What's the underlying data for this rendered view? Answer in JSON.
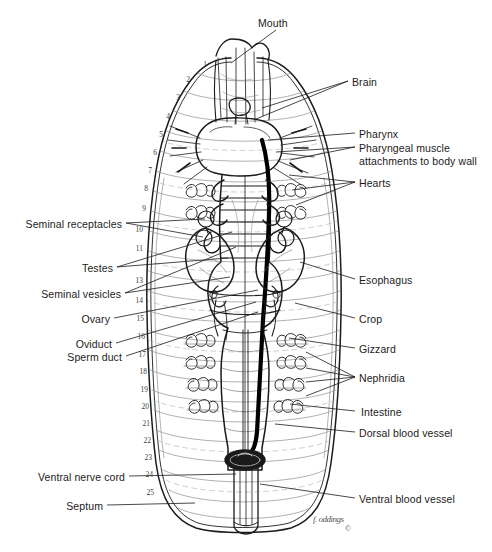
{
  "figure": {
    "background_color": "#ffffff",
    "ink_color": "#1a1a1a",
    "signature": "f. oddings",
    "copyright_mark": "©"
  },
  "labels": {
    "top": [
      {
        "text": "Mouth",
        "side": "center",
        "x": 258,
        "y": 17,
        "leader": [
          [
            276,
            30
          ],
          [
            231,
            63
          ]
        ]
      }
    ],
    "right": [
      {
        "text": "Brain",
        "x": 352,
        "y": 76,
        "leaders": [
          [
            [
              348,
              81
            ],
            [
              262,
              108
            ]
          ],
          [
            [
              348,
              81
            ],
            [
              256,
              119
            ]
          ]
        ]
      },
      {
        "text": "Pharynx",
        "x": 359,
        "y": 128,
        "leaders": [
          [
            [
              355,
              133
            ],
            [
              268,
              140
            ]
          ]
        ]
      },
      {
        "text": "Pharyngeal muscle",
        "x": 359,
        "y": 142,
        "text2": "attachments to body wall",
        "leaders": [
          [
            [
              355,
              147
            ],
            [
              276,
              152
            ]
          ],
          [
            [
              355,
              147
            ],
            [
              290,
              160
            ]
          ]
        ]
      },
      {
        "text": "Hearts",
        "x": 359,
        "y": 177,
        "leaders": [
          [
            [
              355,
              182
            ],
            [
              289,
              175
            ]
          ],
          [
            [
              355,
              182
            ],
            [
              292,
              190
            ]
          ],
          [
            [
              355,
              182
            ],
            [
              296,
              205
            ]
          ]
        ]
      },
      {
        "text": "Esophagus",
        "x": 359,
        "y": 274,
        "leaders": [
          [
            [
              355,
              279
            ],
            [
              300,
              262
            ]
          ]
        ]
      },
      {
        "text": "Crop",
        "x": 359,
        "y": 313,
        "leaders": [
          [
            [
              355,
              318
            ],
            [
              295,
              303
            ]
          ]
        ]
      },
      {
        "text": "Gizzard",
        "x": 359,
        "y": 343,
        "leaders": [
          [
            [
              355,
              348
            ],
            [
              289,
              338
            ]
          ]
        ]
      },
      {
        "text": "Nephridia",
        "x": 359,
        "y": 372,
        "leaders": [
          [
            [
              355,
              377
            ],
            [
              306,
              352
            ]
          ],
          [
            [
              355,
              377
            ],
            [
              306,
              368
            ]
          ],
          [
            [
              355,
              377
            ],
            [
              306,
              382
            ]
          ],
          [
            [
              355,
              377
            ],
            [
              306,
              396
            ]
          ]
        ]
      },
      {
        "text": "Intestine",
        "x": 361,
        "y": 406,
        "leaders": [
          [
            [
              355,
              411
            ],
            [
              290,
              404
            ]
          ]
        ]
      },
      {
        "text": "Dorsal blood vessel",
        "x": 359,
        "y": 427,
        "leaders": [
          [
            [
              355,
              432
            ],
            [
              275,
              424
            ]
          ]
        ]
      },
      {
        "text": "Ventral blood vessel",
        "x": 359,
        "y": 493,
        "leaders": [
          [
            [
              355,
              498
            ],
            [
              260,
              484
            ]
          ]
        ]
      }
    ],
    "left": [
      {
        "text": "Seminal receptacles",
        "x": 122,
        "y": 218,
        "leaders": [
          [
            [
              126,
              223
            ],
            [
              205,
              219
            ]
          ],
          [
            [
              126,
              223
            ],
            [
              203,
              237
            ]
          ]
        ]
      },
      {
        "text": "Testes",
        "x": 113,
        "y": 262,
        "leaders": [
          [
            [
              117,
              267
            ],
            [
              232,
              232
            ]
          ],
          [
            [
              117,
              267
            ],
            [
              228,
              258
            ]
          ]
        ]
      },
      {
        "text": "Seminal vesicles",
        "x": 121,
        "y": 288,
        "leaders": [
          [
            [
              125,
              293
            ],
            [
              236,
              247
            ]
          ],
          [
            [
              125,
              293
            ],
            [
              230,
              277
            ]
          ]
        ]
      },
      {
        "text": "Ovary",
        "x": 110,
        "y": 313,
        "leaders": [
          [
            [
              114,
              318
            ],
            [
              258,
              290
            ]
          ]
        ]
      },
      {
        "text": "Oviduct",
        "x": 112,
        "y": 338,
        "leaders": [
          [
            [
              116,
              343
            ],
            [
              256,
              302
            ]
          ]
        ]
      },
      {
        "text": "Sperm duct",
        "x": 122,
        "y": 351,
        "leaders": [
          [
            [
              126,
              356
            ],
            [
              258,
              312
            ]
          ]
        ]
      },
      {
        "text": "Ventral nerve cord",
        "x": 125,
        "y": 471,
        "leaders": [
          [
            [
              129,
              476
            ],
            [
              236,
              474
            ]
          ]
        ]
      },
      {
        "text": "Septum",
        "x": 103,
        "y": 500,
        "leaders": [
          [
            [
              107,
              505
            ],
            [
              195,
              503
            ]
          ]
        ]
      }
    ]
  },
  "segment_numbers": [
    {
      "n": "1",
      "x": 207,
      "y": 61
    },
    {
      "n": "2",
      "x": 190,
      "y": 76
    },
    {
      "n": "3",
      "x": 180,
      "y": 94
    },
    {
      "n": "4",
      "x": 170,
      "y": 113
    },
    {
      "n": "5",
      "x": 163,
      "y": 131
    },
    {
      "n": "6",
      "x": 157,
      "y": 149
    },
    {
      "n": "7",
      "x": 152,
      "y": 167
    },
    {
      "n": "8",
      "x": 148,
      "y": 185
    },
    {
      "n": "9",
      "x": 146,
      "y": 205
    },
    {
      "n": "10",
      "x": 143,
      "y": 226
    },
    {
      "n": "11",
      "x": 143,
      "y": 245
    },
    {
      "n": "13",
      "x": 143,
      "y": 277
    },
    {
      "n": "14",
      "x": 143,
      "y": 297
    },
    {
      "n": "15",
      "x": 144,
      "y": 315
    },
    {
      "n": "16",
      "x": 145,
      "y": 333
    },
    {
      "n": "17",
      "x": 146,
      "y": 351
    },
    {
      "n": "18",
      "x": 147,
      "y": 368
    },
    {
      "n": "19",
      "x": 148,
      "y": 386
    },
    {
      "n": "20",
      "x": 149,
      "y": 403
    },
    {
      "n": "21",
      "x": 150,
      "y": 420
    },
    {
      "n": "22",
      "x": 151,
      "y": 437
    },
    {
      "n": "23",
      "x": 152,
      "y": 454
    },
    {
      "n": "24",
      "x": 153,
      "y": 471
    },
    {
      "n": "25",
      "x": 154,
      "y": 489
    }
  ]
}
